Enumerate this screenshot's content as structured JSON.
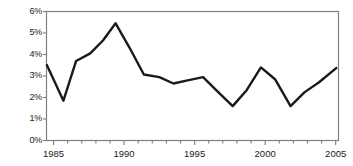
{
  "chart_data": {
    "type": "line",
    "title": "",
    "subtitle": "",
    "xlabel": "",
    "ylabel": "",
    "xlim": [
      1984.5,
      2005.2
    ],
    "ylim": [
      0,
      6
    ],
    "grid": false,
    "legend": null,
    "y_tick_labels": [
      "0%",
      "1%",
      "2%",
      "3%",
      "4%",
      "5%",
      "6%"
    ],
    "y_tick_values": [
      0,
      1,
      2,
      3,
      4,
      5,
      6
    ],
    "x_tick_labels": [
      "1985",
      "1990",
      "1995",
      "2000",
      "2005"
    ],
    "x_tick_values": [
      1985,
      1990,
      1995,
      2000,
      2005
    ],
    "x_minor_tick_interval": 1,
    "line_color": "#1a1a1a",
    "line_width": 2.4,
    "axis_color": "#808080",
    "series": [
      {
        "name": "series-1",
        "x": [
          1984.5,
          1985.7,
          1986.6,
          1987.6,
          1988.5,
          1989.4,
          1990.4,
          1991.4,
          1992.5,
          1993.5,
          1994.5,
          1995.6,
          1996.6,
          1997.7,
          1998.7,
          1999.7,
          2000.7,
          2001.8,
          2002.8,
          2003.8,
          2005.1
        ],
        "values": [
          3.55,
          1.85,
          3.7,
          4.05,
          4.65,
          5.45,
          4.3,
          3.07,
          2.95,
          2.65,
          2.8,
          2.95,
          2.3,
          1.6,
          2.35,
          3.4,
          2.85,
          1.6,
          2.25,
          2.7,
          3.4
        ]
      }
    ]
  }
}
